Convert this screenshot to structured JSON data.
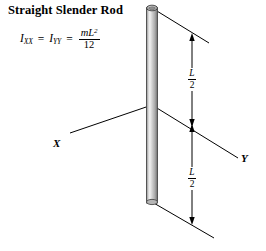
{
  "title": "Straight Slender Rod",
  "formula": {
    "i_symbol": "I",
    "sub_xx": "XX",
    "equals_1": "=",
    "i_symbol_2": "I",
    "sub_yy": "YY",
    "equals_2": "=",
    "numerator": "mL",
    "numerator_exponent": "2",
    "denominator": "12"
  },
  "axes": {
    "x_label": "X",
    "y_label": "Y"
  },
  "dimensions": {
    "upper": {
      "numerator": "L",
      "denominator": "2"
    },
    "lower": {
      "numerator": "L",
      "denominator": "2"
    }
  },
  "colors": {
    "line": "#000000",
    "rod_edge": "#4a4a4a",
    "rod_light": "#f0f0f0",
    "rod_mid": "#bdbdbd",
    "rod_dark": "#8a8a8a",
    "background": "#ffffff"
  },
  "geometry": {
    "rod_top_y": 8,
    "rod_bottom_y": 202,
    "origin_x": 152,
    "origin_y": 105,
    "dimension_line_x": 192,
    "dimension_top_y": 36,
    "dimension_mid_y": 125,
    "dimension_bottom_y": 222
  }
}
